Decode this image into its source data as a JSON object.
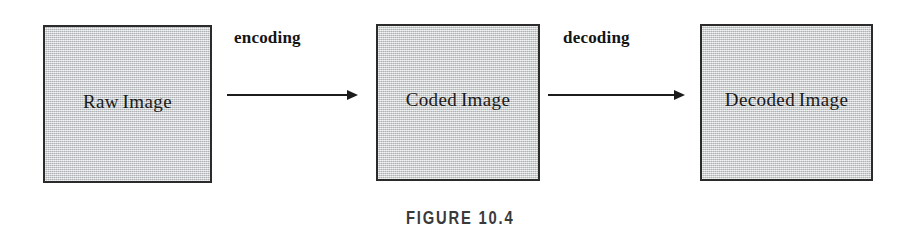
{
  "figure": {
    "caption": "FIGURE 10.4",
    "background_color": "#ffffff",
    "box_fill_color": "#c9cccd",
    "box_border_color": "#2b2b2b",
    "text_color": "#1a1a1a"
  },
  "diagram": {
    "type": "flow",
    "nodes": [
      {
        "id": "raw",
        "label": "Raw Image"
      },
      {
        "id": "coded",
        "label": "Coded Image"
      },
      {
        "id": "decoded",
        "label": "Decoded Image"
      }
    ],
    "edges": [
      {
        "id": "encoding",
        "label": "encoding",
        "from": "raw",
        "to": "coded",
        "direction": "right"
      },
      {
        "id": "decoding",
        "label": "decoding",
        "from": "coded",
        "to": "decoded",
        "direction": "right"
      }
    ]
  }
}
